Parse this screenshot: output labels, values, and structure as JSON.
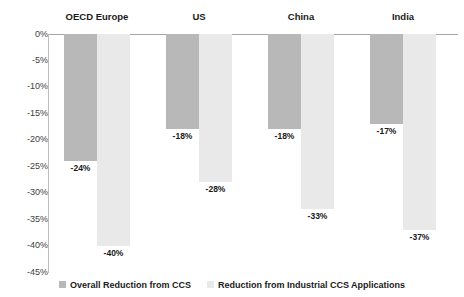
{
  "chart_data": {
    "type": "bar",
    "title": "",
    "subtitle": "",
    "xlabel": "",
    "ylabel": "",
    "ylim": [
      -45,
      0
    ],
    "grid": false,
    "legend_position": "bottom",
    "orientation": "vertical",
    "categories": [
      "OECD Europe",
      "US",
      "China",
      "India"
    ],
    "y_ticks": [
      "0%",
      "-5%",
      "-10%",
      "-15%",
      "-20%",
      "-25%",
      "-30%",
      "-35%",
      "-40%",
      "-45%"
    ],
    "y_tick_values": [
      0,
      -5,
      -10,
      -15,
      -20,
      -25,
      -30,
      -35,
      -40,
      -45
    ],
    "series": [
      {
        "name": "Overall Reduction from CCS",
        "color": "#b8b8b8",
        "values": [
          -24,
          -18,
          -18,
          -17
        ],
        "labels": [
          "-24%",
          "-18%",
          "-18%",
          "-17%"
        ]
      },
      {
        "name": "Reduction from Industrial CCS Applications",
        "color": "#e9e9e9",
        "values": [
          -40,
          -28,
          -33,
          -37
        ],
        "labels": [
          "-40%",
          "-28%",
          "-33%",
          "-37%"
        ]
      }
    ]
  },
  "legend": {
    "items": [
      {
        "label": "Overall Reduction from CCS",
        "color": "#b8b8b8"
      },
      {
        "label": "Reduction from Industrial CCS Applications",
        "color": "#e9e9e9"
      }
    ]
  },
  "colors": {
    "series_0": "#b8b8b8",
    "series_1": "#e9e9e9",
    "axis": "#bfbfbf",
    "zero_line": "#a6a6a6",
    "text": "#1a1a1a",
    "tick_text": "#404040",
    "background": "#ffffff"
  }
}
